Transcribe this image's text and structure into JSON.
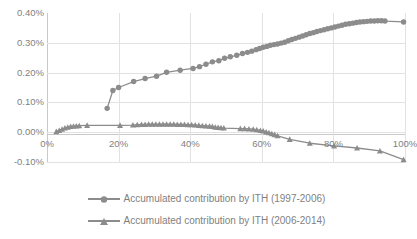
{
  "chart_data": {
    "type": "line",
    "title": "",
    "xlabel": "",
    "ylabel": "",
    "xlim": [
      0,
      1.0
    ],
    "ylim": [
      -0.001,
      0.004
    ],
    "grid": true,
    "legend_position": "bottom",
    "x_tick_labels": [
      "0%",
      "20%",
      "40%",
      "60%",
      "80%",
      "100%"
    ],
    "x_tick_values": [
      0,
      20,
      40,
      60,
      80,
      100
    ],
    "y_tick_labels": [
      "0.40%",
      "0.30%",
      "0.20%",
      "0.10%",
      "0.00%",
      "-0.10%"
    ],
    "y_tick_values": [
      0.4,
      0.3,
      0.2,
      0.1,
      0.0,
      -0.1
    ],
    "series": [
      {
        "name": "Accumulated contribution by ITH (1997-2006)",
        "marker": "circle",
        "color": "#8c8c8c",
        "x": [
          16.8,
          18.4,
          20.0,
          24.2,
          27.4,
          30.6,
          33.4,
          37.2,
          40.8,
          42.6,
          44.4,
          46.2,
          48.0,
          49.6,
          51.2,
          53.0,
          54.6,
          56.0,
          57.2,
          58.4,
          59.4,
          60.4,
          61.4,
          62.4,
          63.4,
          64.4,
          65.4,
          66.4,
          67.4,
          68.4,
          69.4,
          70.4,
          71.4,
          72.4,
          73.4,
          74.4,
          75.4,
          76.4,
          77.4,
          78.4,
          79.4,
          80.4,
          81.4,
          82.4,
          83.4,
          84.4,
          85.4,
          86.4,
          87.4,
          88.4,
          89.4,
          90.4,
          91.4,
          92.4,
          93.4,
          94.4,
          99.6
        ],
        "y": [
          0.08,
          0.14,
          0.15,
          0.17,
          0.18,
          0.188,
          0.201,
          0.208,
          0.214,
          0.22,
          0.228,
          0.236,
          0.24,
          0.248,
          0.253,
          0.258,
          0.264,
          0.268,
          0.272,
          0.277,
          0.281,
          0.285,
          0.288,
          0.292,
          0.294,
          0.296,
          0.299,
          0.302,
          0.307,
          0.311,
          0.315,
          0.319,
          0.323,
          0.327,
          0.331,
          0.334,
          0.338,
          0.341,
          0.344,
          0.347,
          0.35,
          0.353,
          0.356,
          0.359,
          0.362,
          0.364,
          0.366,
          0.368,
          0.37,
          0.371,
          0.372,
          0.373,
          0.373,
          0.374,
          0.374,
          0.373,
          0.37
        ]
      },
      {
        "name": "Accumulated contribution by ITH (2006-2014)",
        "marker": "triangle",
        "color": "#8c8c8c",
        "x": [
          2.6,
          3.4,
          4.2,
          5.0,
          5.8,
          6.6,
          7.4,
          8.2,
          9.0,
          11.2,
          20.4,
          24.0,
          25.2,
          26.4,
          27.4,
          28.4,
          29.4,
          30.4,
          31.4,
          32.4,
          33.4,
          34.4,
          35.4,
          36.4,
          37.4,
          38.4,
          39.4,
          40.4,
          41.4,
          42.4,
          43.4,
          44.4,
          45.4,
          46.2,
          47.0,
          47.8,
          48.6,
          49.4,
          54.0,
          55.2,
          56.4,
          57.6,
          58.6,
          59.6,
          60.4,
          61.2,
          62.0,
          62.8,
          63.6,
          64.4,
          67.8,
          73.4,
          80.2,
          86.6,
          93.0,
          99.6
        ],
        "y": [
          0.002,
          0.006,
          0.01,
          0.014,
          0.017,
          0.019,
          0.02,
          0.021,
          0.022,
          0.023,
          0.023,
          0.024,
          0.025,
          0.026,
          0.026,
          0.027,
          0.027,
          0.027,
          0.027,
          0.027,
          0.027,
          0.027,
          0.027,
          0.026,
          0.026,
          0.026,
          0.025,
          0.025,
          0.024,
          0.023,
          0.022,
          0.021,
          0.02,
          0.019,
          0.017,
          0.016,
          0.015,
          0.014,
          0.012,
          0.012,
          0.011,
          0.01,
          0.008,
          0.006,
          0.004,
          0.001,
          -0.002,
          -0.005,
          -0.008,
          -0.012,
          -0.024,
          -0.037,
          -0.046,
          -0.053,
          -0.063,
          -0.092
        ]
      }
    ]
  },
  "legend": {
    "entries": [
      {
        "label": "Accumulated contribution by ITH (1997-2006)",
        "marker": "circle"
      },
      {
        "label": "Accumulated contribution by ITH (2006-2014)",
        "marker": "triangle"
      }
    ]
  }
}
